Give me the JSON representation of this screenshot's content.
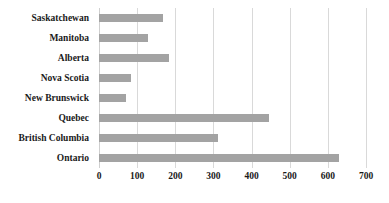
{
  "chart_data": {
    "type": "bar",
    "orientation": "horizontal",
    "title": "",
    "subtitle": "",
    "xlabel": "",
    "ylabel": "",
    "categories": [
      "Saskatchewan",
      "Manitoba",
      "Alberta",
      "Nova Scotia",
      "New Brunswick",
      "Quebec",
      "British Columbia",
      "Ontario"
    ],
    "values": [
      168,
      128,
      184,
      84,
      71,
      445,
      313,
      628
    ],
    "series": [
      {
        "name": "",
        "values": [
          168,
          128,
          184,
          84,
          71,
          445,
          313,
          628
        ]
      }
    ],
    "xlim": [
      0,
      700
    ],
    "xticks": [
      0,
      100,
      200,
      300,
      400,
      500,
      600,
      700
    ],
    "xtick_labels": [
      "0",
      "100",
      "200",
      "300",
      "400",
      "500",
      "600",
      "700"
    ],
    "grid": true,
    "grid_axis": "x",
    "legend": false,
    "legend_position": "none",
    "bar_color": "#a3a3a3",
    "grid_color": "#d9d9d9",
    "text_color": "#1a1a1a",
    "background_color": "#ffffff",
    "annotations": []
  }
}
